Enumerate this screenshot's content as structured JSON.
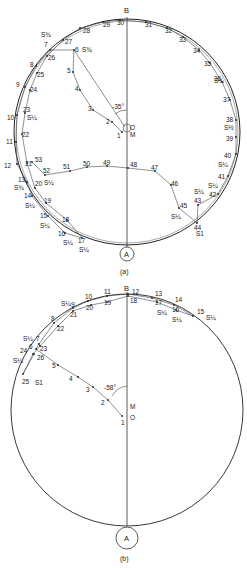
{
  "diagram_a": {
    "caption": "(a)",
    "top_label": "B",
    "bottom_label": "A",
    "center_label": "O",
    "center_sub": "M",
    "angle_label": "-35°",
    "points": [
      {
        "n": "1",
        "x": 122,
        "y": 132
      },
      {
        "n": "2",
        "x": 112,
        "y": 122
      },
      {
        "n": "3",
        "x": 93,
        "y": 110
      },
      {
        "n": "4",
        "x": 80,
        "y": 90
      },
      {
        "n": "5",
        "x": 73,
        "y": 72
      },
      {
        "n": "6",
        "x": 74,
        "y": 50
      },
      {
        "n": "7",
        "x": 50,
        "y": 50
      },
      {
        "n": "8",
        "x": 36,
        "y": 66
      },
      {
        "n": "9",
        "x": 25,
        "y": 87
      },
      {
        "n": "10",
        "x": 17,
        "y": 115
      },
      {
        "n": "11",
        "x": 16,
        "y": 142
      },
      {
        "n": "12",
        "x": 17,
        "y": 164
      },
      {
        "n": "13",
        "x": 27,
        "y": 182
      },
      {
        "n": "14",
        "x": 32,
        "y": 196
      },
      {
        "n": "15",
        "x": 48,
        "y": 216
      },
      {
        "n": "16",
        "x": 65,
        "y": 233
      },
      {
        "n": "17",
        "x": 82,
        "y": 238
      },
      {
        "n": "18",
        "x": 67,
        "y": 220
      },
      {
        "n": "19",
        "x": 46,
        "y": 203
      },
      {
        "n": "20",
        "x": 35,
        "y": 188
      },
      {
        "n": "21",
        "x": 27,
        "y": 163
      },
      {
        "n": "22",
        "x": 22,
        "y": 134
      },
      {
        "n": "23",
        "x": 25,
        "y": 113
      },
      {
        "n": "24",
        "x": 30,
        "y": 90
      },
      {
        "n": "25",
        "x": 37,
        "y": 73
      },
      {
        "n": "26",
        "x": 47,
        "y": 56
      },
      {
        "n": "27",
        "x": 63,
        "y": 40
      },
      {
        "n": "28",
        "x": 80,
        "y": 28
      },
      {
        "n": "29",
        "x": 103,
        "y": 22
      },
      {
        "n": "30",
        "x": 120,
        "y": 20
      },
      {
        "n": "31",
        "x": 146,
        "y": 22
      },
      {
        "n": "32",
        "x": 167,
        "y": 28
      },
      {
        "n": "33",
        "x": 183,
        "y": 37
      },
      {
        "n": "34",
        "x": 199,
        "y": 50
      },
      {
        "n": "35",
        "x": 210,
        "y": 63
      },
      {
        "n": "36",
        "x": 222,
        "y": 82
      },
      {
        "n": "37",
        "x": 230,
        "y": 100
      },
      {
        "n": "38",
        "x": 236,
        "y": 120
      },
      {
        "n": "39",
        "x": 236,
        "y": 137
      },
      {
        "n": "40",
        "x": 236,
        "y": 154
      },
      {
        "n": "41",
        "x": 228,
        "y": 176
      },
      {
        "n": "42",
        "x": 218,
        "y": 194
      },
      {
        "n": "43",
        "x": 198,
        "y": 205
      },
      {
        "n": "44",
        "x": 197,
        "y": 223
      },
      {
        "n": "45",
        "x": 179,
        "y": 208
      },
      {
        "n": "46",
        "x": 171,
        "y": 185
      },
      {
        "n": "47",
        "x": 155,
        "y": 171
      },
      {
        "n": "48",
        "x": 128,
        "y": 168
      },
      {
        "n": "49",
        "x": 107,
        "y": 166
      },
      {
        "n": "50",
        "x": 87,
        "y": 167
      },
      {
        "n": "51",
        "x": 70,
        "y": 171
      },
      {
        "n": "52",
        "x": 45,
        "y": 175
      },
      {
        "n": "53",
        "x": 32,
        "y": 162
      }
    ],
    "labels": [
      {
        "t": "1",
        "x": 117,
        "y": 138
      },
      {
        "t": "2",
        "x": 106,
        "y": 124
      },
      {
        "t": "3",
        "x": 88,
        "y": 111
      },
      {
        "t": "4",
        "x": 75,
        "y": 91
      },
      {
        "t": "5",
        "x": 67,
        "y": 73
      },
      {
        "t": "6",
        "x": 75,
        "y": 52
      },
      {
        "t": "7",
        "x": 44,
        "y": 47
      },
      {
        "t": "8",
        "x": 30,
        "y": 67
      },
      {
        "t": "9",
        "x": 16,
        "y": 87
      },
      {
        "t": "10",
        "x": 7,
        "y": 120
      },
      {
        "t": "11",
        "x": 6,
        "y": 144
      },
      {
        "t": "12",
        "x": 4,
        "y": 168
      },
      {
        "t": "13",
        "x": 18,
        "y": 182
      },
      {
        "t": "14",
        "x": 24,
        "y": 198
      },
      {
        "t": "15",
        "x": 40,
        "y": 218
      },
      {
        "t": "16",
        "x": 58,
        "y": 236
      },
      {
        "t": "17",
        "x": 78,
        "y": 243
      },
      {
        "t": "18",
        "x": 62,
        "y": 222
      },
      {
        "t": "19",
        "x": 44,
        "y": 203
      },
      {
        "t": "20",
        "x": 35,
        "y": 186
      },
      {
        "t": "21",
        "x": 25,
        "y": 166
      },
      {
        "t": "22",
        "x": 22,
        "y": 137
      },
      {
        "t": "23",
        "x": 23,
        "y": 112
      },
      {
        "t": "24",
        "x": 30,
        "y": 92
      },
      {
        "t": "25",
        "x": 37,
        "y": 77
      },
      {
        "t": "26",
        "x": 48,
        "y": 60
      },
      {
        "t": "27",
        "x": 65,
        "y": 44
      },
      {
        "t": "28",
        "x": 83,
        "y": 33
      },
      {
        "t": "29",
        "x": 103,
        "y": 27
      },
      {
        "t": "30",
        "x": 117,
        "y": 25
      },
      {
        "t": "31",
        "x": 145,
        "y": 27
      },
      {
        "t": "32",
        "x": 165,
        "y": 33
      },
      {
        "t": "33",
        "x": 179,
        "y": 42
      },
      {
        "t": "34",
        "x": 193,
        "y": 53
      },
      {
        "t": "35",
        "x": 204,
        "y": 66
      },
      {
        "t": "36",
        "x": 214,
        "y": 81
      },
      {
        "t": "37",
        "x": 223,
        "y": 102
      },
      {
        "t": "38",
        "x": 226,
        "y": 122
      },
      {
        "t": "39",
        "x": 226,
        "y": 141
      },
      {
        "t": "40",
        "x": 224,
        "y": 158
      },
      {
        "t": "41",
        "x": 218,
        "y": 179
      },
      {
        "t": "42",
        "x": 209,
        "y": 197
      },
      {
        "t": "43",
        "x": 194,
        "y": 203
      },
      {
        "t": "44",
        "x": 194,
        "y": 230
      },
      {
        "t": "45",
        "x": 180,
        "y": 208
      },
      {
        "t": "46",
        "x": 171,
        "y": 186
      },
      {
        "t": "47",
        "x": 151,
        "y": 170
      },
      {
        "t": "48",
        "x": 130,
        "y": 167
      },
      {
        "t": "49",
        "x": 103,
        "y": 165
      },
      {
        "t": "50",
        "x": 83,
        "y": 166
      },
      {
        "t": "51",
        "x": 63,
        "y": 169
      },
      {
        "t": "52",
        "x": 43,
        "y": 173
      },
      {
        "t": "53",
        "x": 35,
        "y": 162
      }
    ],
    "s_marks": [
      {
        "t": "S¾",
        "x": 41,
        "y": 37
      },
      {
        "t": "S¾",
        "x": 82,
        "y": 52
      },
      {
        "t": "S¼",
        "x": 27,
        "y": 120
      },
      {
        "t": "S¾",
        "x": 14,
        "y": 190
      },
      {
        "t": "S¼",
        "x": 25,
        "y": 208
      },
      {
        "t": "S¼",
        "x": 40,
        "y": 228
      },
      {
        "t": "S¼",
        "x": 63,
        "y": 245
      },
      {
        "t": "S¼",
        "x": 79,
        "y": 252
      },
      {
        "t": "S¼",
        "x": 44,
        "y": 185
      },
      {
        "t": "S¼",
        "x": 214,
        "y": 83
      },
      {
        "t": "S½",
        "x": 224,
        "y": 130
      },
      {
        "t": "S¼",
        "x": 218,
        "y": 167
      },
      {
        "t": "S¼",
        "x": 208,
        "y": 188
      },
      {
        "t": "S¼",
        "x": 194,
        "y": 194
      },
      {
        "t": "S¼",
        "x": 171,
        "y": 219
      },
      {
        "t": "S1",
        "x": 196,
        "y": 236
      }
    ]
  },
  "diagram_b": {
    "caption": "(b)",
    "top_label": "B",
    "bottom_label": "A",
    "center_label": "O",
    "center_sub": "M",
    "angle_label": "-58°",
    "points": [
      {
        "n": "1",
        "x": 122,
        "y": 416
      },
      {
        "n": "2",
        "x": 108,
        "y": 400
      },
      {
        "n": "3",
        "x": 93,
        "y": 387
      },
      {
        "n": "4",
        "x": 78,
        "y": 377
      },
      {
        "n": "5",
        "x": 58,
        "y": 365
      },
      {
        "n": "6",
        "x": 36,
        "y": 349
      },
      {
        "n": "7",
        "x": 39,
        "y": 344
      },
      {
        "n": "8",
        "x": 54,
        "y": 323
      },
      {
        "n": "9",
        "x": 73,
        "y": 308
      },
      {
        "n": "10",
        "x": 88,
        "y": 301
      },
      {
        "n": "11",
        "x": 107,
        "y": 296
      },
      {
        "n": "12",
        "x": 128,
        "y": 294
      },
      {
        "n": "13",
        "x": 152,
        "y": 298
      },
      {
        "n": "14",
        "x": 174,
        "y": 305
      },
      {
        "n": "15",
        "x": 193,
        "y": 316
      },
      {
        "n": "16",
        "x": 176,
        "y": 310
      },
      {
        "n": "17",
        "x": 157,
        "y": 302
      },
      {
        "n": "18",
        "x": 128,
        "y": 296
      },
      {
        "n": "19",
        "x": 107,
        "y": 302
      },
      {
        "n": "20",
        "x": 91,
        "y": 305
      },
      {
        "n": "21",
        "x": 73,
        "y": 311
      },
      {
        "n": "22",
        "x": 58,
        "y": 326
      },
      {
        "n": "23",
        "x": 40,
        "y": 346
      },
      {
        "n": "24",
        "x": 33,
        "y": 354
      },
      {
        "n": "25",
        "x": 23,
        "y": 374
      },
      {
        "n": "26",
        "x": 34,
        "y": 354
      }
    ],
    "labels": [
      {
        "t": "1",
        "x": 121,
        "y": 425
      },
      {
        "t": "2",
        "x": 101,
        "y": 405
      },
      {
        "t": "3",
        "x": 86,
        "y": 392
      },
      {
        "t": "4",
        "x": 69,
        "y": 381
      },
      {
        "t": "5",
        "x": 52,
        "y": 368
      },
      {
        "t": "6",
        "x": 29,
        "y": 349
      },
      {
        "t": "7",
        "x": 36,
        "y": 341
      },
      {
        "t": "8",
        "x": 51,
        "y": 321
      },
      {
        "t": "9",
        "x": 71,
        "y": 307
      },
      {
        "t": "10",
        "x": 85,
        "y": 299
      },
      {
        "t": "11",
        "x": 104,
        "y": 294
      },
      {
        "t": "12",
        "x": 132,
        "y": 294
      },
      {
        "t": "13",
        "x": 155,
        "y": 296
      },
      {
        "t": "14",
        "x": 175,
        "y": 302
      },
      {
        "t": "15",
        "x": 197,
        "y": 314
      },
      {
        "t": "16",
        "x": 172,
        "y": 312
      },
      {
        "t": "17",
        "x": 155,
        "y": 305
      },
      {
        "t": "18",
        "x": 130,
        "y": 303
      },
      {
        "t": "19",
        "x": 104,
        "y": 305
      },
      {
        "t": "20",
        "x": 86,
        "y": 310
      },
      {
        "t": "21",
        "x": 70,
        "y": 317
      },
      {
        "t": "22",
        "x": 57,
        "y": 331
      },
      {
        "t": "23",
        "x": 40,
        "y": 351
      },
      {
        "t": "24",
        "x": 20,
        "y": 353
      },
      {
        "t": "25",
        "x": 22,
        "y": 384
      },
      {
        "t": "26",
        "x": 37,
        "y": 360
      }
    ],
    "s_marks": [
      {
        "t": "S¼",
        "x": 61,
        "y": 306
      },
      {
        "t": "S¼",
        "x": 23,
        "y": 341
      },
      {
        "t": "S¼",
        "x": 13,
        "y": 363
      },
      {
        "t": "S1",
        "x": 35,
        "y": 385
      },
      {
        "t": "S¼",
        "x": 157,
        "y": 315
      },
      {
        "t": "S¼",
        "x": 172,
        "y": 322
      },
      {
        "t": "S¼",
        "x": 206,
        "y": 320
      }
    ]
  }
}
